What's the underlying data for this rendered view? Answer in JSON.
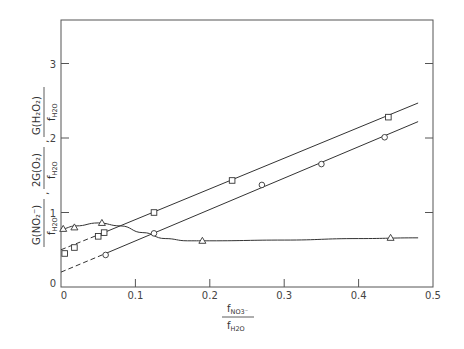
{
  "chart_data": {
    "type": "line",
    "title": "",
    "xlabel": "f_NO3- / f_H2O",
    "ylabel": "G(NO2-)/f_H2O , 2G(O2)/f_H2O , G(H2O2)/f_H2O",
    "xlim": [
      0,
      0.5
    ],
    "ylim": [
      0,
      3.6
    ],
    "xticks": [
      "0",
      "0.1",
      "0.2",
      "0.3",
      "0.4",
      "0.5"
    ],
    "yticks": [
      "0",
      "1",
      "2",
      "3"
    ],
    "grid": false,
    "legend": "none",
    "series": [
      {
        "name": "squares",
        "marker": "square",
        "x": [
          0.005,
          0.018,
          0.05,
          0.058,
          0.125,
          0.23,
          0.44
        ],
        "y": [
          0.45,
          0.53,
          0.68,
          0.73,
          1.0,
          1.43,
          2.28
        ],
        "fit_line": {
          "x": [
            0,
            0.06,
            0.48
          ],
          "y": [
            0.5,
            0.74,
            2.47
          ],
          "dashed_until": 0.06
        }
      },
      {
        "name": "circles",
        "marker": "circle",
        "x": [
          0.06,
          0.125,
          0.27,
          0.35,
          0.435
        ],
        "y": [
          0.43,
          0.72,
          1.37,
          1.65,
          2.01
        ],
        "fit_line": {
          "x": [
            0,
            0.06,
            0.48
          ],
          "y": [
            0.2,
            0.45,
            2.22
          ],
          "dashed_until": 0.06
        }
      },
      {
        "name": "triangles",
        "marker": "triangle",
        "x": [
          0.003,
          0.018,
          0.055,
          0.19,
          0.443
        ],
        "y": [
          0.78,
          0.8,
          0.86,
          0.62,
          0.66
        ],
        "curve": {
          "x": [
            0,
            0.02,
            0.05,
            0.08,
            0.11,
            0.14,
            0.17,
            0.2,
            0.3,
            0.4,
            0.48
          ],
          "y": [
            0.78,
            0.82,
            0.86,
            0.82,
            0.73,
            0.65,
            0.62,
            0.62,
            0.63,
            0.65,
            0.66
          ]
        }
      }
    ]
  },
  "labels": {
    "origin_y": "0",
    "x_num": "f",
    "x_num_sub": "NO3⁻",
    "x_den": "f",
    "x_den_sub": "H2O",
    "y_term1_num": "G(NO₂⁻)",
    "y_term2_num": "2G(O₂)",
    "y_term3_num": "G(H₂O₂)",
    "y_den": "f",
    "y_den_sub": "H2O",
    "sep": ","
  }
}
